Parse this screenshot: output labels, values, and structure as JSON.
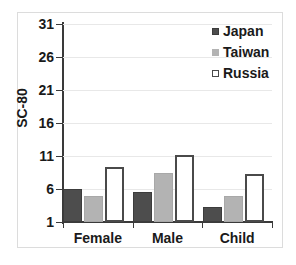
{
  "chart_data": {
    "type": "bar",
    "title": "",
    "xlabel": "",
    "ylabel": "SC-80",
    "categories": [
      "Female",
      "Male",
      "Child"
    ],
    "series": [
      {
        "name": "Japan",
        "color": "#4d4d4d",
        "values": [
          6.0,
          5.5,
          3.3
        ]
      },
      {
        "name": "Taiwan",
        "color": "#b3b3b3",
        "values": [
          5.0,
          8.5,
          5.0
        ]
      },
      {
        "name": "Russia",
        "color": "#ffffff",
        "values": [
          9.3,
          11.2,
          8.3
        ]
      }
    ],
    "ylim": [
      1,
      31
    ],
    "yticks": [
      1,
      6,
      11,
      16,
      21,
      26,
      31
    ],
    "ytick_labels": [
      "1",
      "6",
      "11",
      "16",
      "21",
      "26",
      "31"
    ],
    "grid": true,
    "grid_axis": "y",
    "legend_position": "top-right",
    "legend_entries": [
      "Japan",
      "Taiwan",
      "Russia"
    ]
  }
}
